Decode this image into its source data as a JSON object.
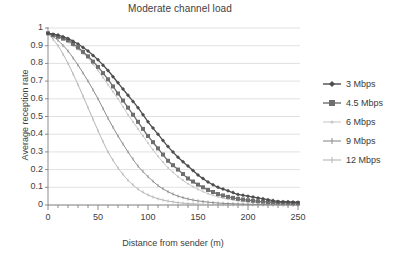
{
  "chart_data": {
    "type": "line",
    "title": "Moderate channel load",
    "xlabel": "Distance  from sender (m)",
    "ylabel": "Average reception rate",
    "xlim": [
      0,
      250
    ],
    "ylim": [
      0,
      1
    ],
    "grid": "horizontal",
    "legend_position": "right",
    "x_ticks": [
      0,
      50,
      100,
      150,
      200,
      250
    ],
    "x_minor_tick_step": 10,
    "y_ticks": [
      0,
      0.1,
      0.2,
      0.3,
      0.4,
      0.5,
      0.6,
      0.7,
      0.8,
      0.9,
      1
    ],
    "y_tick_labels": [
      "0",
      "0.1",
      "0.2",
      "0.3",
      "0.4",
      "0.5",
      "0.6",
      "0.7",
      "0.8",
      "0.9",
      "1"
    ],
    "x": [
      0,
      10,
      20,
      30,
      40,
      50,
      60,
      70,
      80,
      90,
      100,
      110,
      120,
      130,
      140,
      150,
      160,
      170,
      180,
      190,
      200,
      210,
      220,
      230,
      240,
      250
    ],
    "series": [
      {
        "name": "3 Mbps",
        "color": "#4d4d4d",
        "marker": "diamond",
        "values": [
          0.97,
          0.96,
          0.94,
          0.91,
          0.87,
          0.82,
          0.76,
          0.69,
          0.62,
          0.55,
          0.47,
          0.4,
          0.33,
          0.27,
          0.22,
          0.17,
          0.13,
          0.1,
          0.08,
          0.06,
          0.05,
          0.04,
          0.03,
          0.02,
          0.018,
          0.015
        ]
      },
      {
        "name": "4.5 Mbps",
        "color": "#6e6e6e",
        "marker": "square",
        "values": [
          0.97,
          0.95,
          0.93,
          0.89,
          0.84,
          0.78,
          0.71,
          0.63,
          0.55,
          0.47,
          0.39,
          0.32,
          0.25,
          0.2,
          0.15,
          0.115,
          0.085,
          0.062,
          0.046,
          0.035,
          0.027,
          0.021,
          0.017,
          0.014,
          0.012,
          0.01
        ]
      },
      {
        "name": "6 Mbps",
        "color": "#c8c8c8",
        "marker": "dot",
        "values": [
          0.97,
          0.95,
          0.92,
          0.88,
          0.83,
          0.76,
          0.68,
          0.6,
          0.51,
          0.43,
          0.35,
          0.275,
          0.21,
          0.16,
          0.12,
          0.088,
          0.064,
          0.046,
          0.033,
          0.024,
          0.018,
          0.013,
          0.01,
          0.008,
          0.007,
          0.006
        ]
      },
      {
        "name": "9 Mbps",
        "color": "#8c8c8c",
        "marker": "line",
        "values": [
          0.97,
          0.93,
          0.87,
          0.79,
          0.7,
          0.6,
          0.49,
          0.39,
          0.3,
          0.22,
          0.16,
          0.11,
          0.075,
          0.05,
          0.034,
          0.023,
          0.016,
          0.011,
          0.008,
          0.006,
          0.004,
          0.003,
          0.002,
          0.002,
          0.001,
          0.001
        ]
      },
      {
        "name": "12 Mbps",
        "color": "#b5b5b5",
        "marker": "line",
        "values": [
          0.97,
          0.9,
          0.8,
          0.68,
          0.55,
          0.42,
          0.3,
          0.21,
          0.14,
          0.09,
          0.057,
          0.035,
          0.022,
          0.013,
          0.008,
          0.005,
          0.003,
          0.002,
          0.0015,
          0.001,
          0.001,
          0.0005,
          0.0005,
          0.0005,
          0.0005,
          0.0005
        ]
      }
    ]
  },
  "legend": {
    "items": [
      {
        "label": "3 Mbps"
      },
      {
        "label": "4.5 Mbps"
      },
      {
        "label": "6 Mbps"
      },
      {
        "label": "9 Mbps"
      },
      {
        "label": "12 Mbps"
      }
    ]
  },
  "colors": {
    "grid": "#d9d9d9",
    "axis": "#808080",
    "text": "#3a3a3a",
    "background": "#ffffff"
  }
}
